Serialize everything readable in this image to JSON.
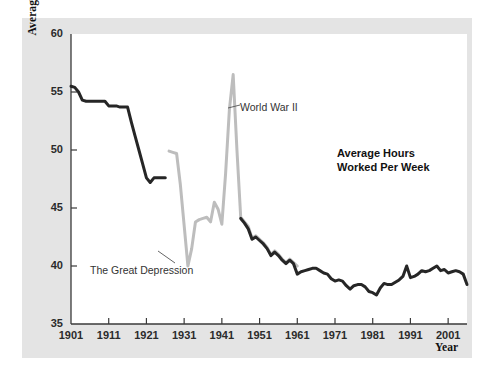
{
  "chart_data": {
    "type": "line",
    "title": "Average Hours\nWorked Per Week",
    "title_line1": "Average Hours",
    "title_line2": "Worked Per Week",
    "xlabel": "Year",
    "ylabel": "Average hours worked per week",
    "xlim": [
      1901,
      2006
    ],
    "ylim": [
      35,
      60
    ],
    "yticks": [
      35,
      40,
      45,
      50,
      55,
      60
    ],
    "xticks": [
      1901,
      1911,
      1921,
      1931,
      1941,
      1951,
      1961,
      1971,
      1981,
      1991,
      2001
    ],
    "grid": false,
    "legend": "none",
    "annotations": [
      {
        "label": "World War II",
        "x": 1944,
        "y": 56.5
      },
      {
        "label": "The Great Depression",
        "x": 1932,
        "y": 39.8
      }
    ],
    "series": [
      {
        "name": "Early period (dark)",
        "color": "#262626",
        "points": [
          [
            1901,
            55.5
          ],
          [
            1902,
            55.4
          ],
          [
            1903,
            55.0
          ],
          [
            1904,
            54.3
          ],
          [
            1905,
            54.2
          ],
          [
            1906,
            54.2
          ],
          [
            1907,
            54.2
          ],
          [
            1908,
            54.2
          ],
          [
            1909,
            54.2
          ],
          [
            1910,
            54.2
          ],
          [
            1911,
            53.8
          ],
          [
            1912,
            53.8
          ],
          [
            1913,
            53.8
          ],
          [
            1914,
            53.7
          ],
          [
            1915,
            53.7
          ],
          [
            1916,
            53.7
          ],
          [
            1917,
            52.4
          ],
          [
            1918,
            51.2
          ],
          [
            1919,
            50.0
          ],
          [
            1920,
            48.8
          ],
          [
            1921,
            47.6
          ],
          [
            1922,
            47.2
          ],
          [
            1923,
            47.6
          ],
          [
            1924,
            47.6
          ],
          [
            1925,
            47.6
          ],
          [
            1926,
            47.6
          ]
        ]
      },
      {
        "name": "Mid period (light)",
        "color": "#bdbdbd",
        "points": [
          [
            1927,
            49.9
          ],
          [
            1928,
            49.8
          ],
          [
            1929,
            49.7
          ],
          [
            1930,
            47.0
          ],
          [
            1931,
            43.5
          ],
          [
            1932,
            40.0
          ],
          [
            1933,
            41.5
          ],
          [
            1934,
            43.8
          ],
          [
            1935,
            44.0
          ],
          [
            1936,
            44.1
          ],
          [
            1937,
            44.2
          ],
          [
            1938,
            43.8
          ],
          [
            1939,
            45.5
          ],
          [
            1940,
            44.9
          ],
          [
            1941,
            43.6
          ],
          [
            1942,
            48.0
          ],
          [
            1943,
            53.5
          ],
          [
            1944,
            56.5
          ],
          [
            1945,
            50.0
          ],
          [
            1946,
            44.2
          ],
          [
            1947,
            43.8
          ],
          [
            1948,
            43.4
          ],
          [
            1949,
            42.4
          ],
          [
            1950,
            42.6
          ],
          [
            1951,
            42.3
          ],
          [
            1952,
            42.0
          ],
          [
            1953,
            41.6
          ],
          [
            1954,
            41.0
          ],
          [
            1955,
            41.3
          ],
          [
            1956,
            41.0
          ],
          [
            1957,
            40.6
          ],
          [
            1958,
            40.3
          ],
          [
            1959,
            40.6
          ],
          [
            1960,
            40.3
          ],
          [
            1961,
            40.0
          ]
        ]
      },
      {
        "name": "Modern period (dark)",
        "color": "#262626",
        "points": [
          [
            1946,
            44.1
          ],
          [
            1947,
            43.7
          ],
          [
            1948,
            43.2
          ],
          [
            1949,
            42.3
          ],
          [
            1950,
            42.5
          ],
          [
            1951,
            42.2
          ],
          [
            1952,
            41.9
          ],
          [
            1953,
            41.5
          ],
          [
            1954,
            40.9
          ],
          [
            1955,
            41.2
          ],
          [
            1956,
            40.9
          ],
          [
            1957,
            40.5
          ],
          [
            1958,
            40.2
          ],
          [
            1959,
            40.5
          ],
          [
            1960,
            40.2
          ],
          [
            1961,
            39.3
          ],
          [
            1962,
            39.5
          ],
          [
            1963,
            39.6
          ],
          [
            1964,
            39.7
          ],
          [
            1965,
            39.8
          ],
          [
            1966,
            39.8
          ],
          [
            1967,
            39.6
          ],
          [
            1968,
            39.4
          ],
          [
            1969,
            39.3
          ],
          [
            1970,
            38.9
          ],
          [
            1971,
            38.7
          ],
          [
            1972,
            38.8
          ],
          [
            1973,
            38.7
          ],
          [
            1974,
            38.3
          ],
          [
            1975,
            38.0
          ],
          [
            1976,
            38.3
          ],
          [
            1977,
            38.4
          ],
          [
            1978,
            38.4
          ],
          [
            1979,
            38.2
          ],
          [
            1980,
            37.8
          ],
          [
            1981,
            37.7
          ],
          [
            1982,
            37.5
          ],
          [
            1983,
            38.1
          ],
          [
            1984,
            38.5
          ],
          [
            1985,
            38.4
          ],
          [
            1986,
            38.4
          ],
          [
            1987,
            38.6
          ],
          [
            1988,
            38.8
          ],
          [
            1989,
            39.1
          ],
          [
            1990,
            40.0
          ],
          [
            1991,
            39.0
          ],
          [
            1992,
            39.1
          ],
          [
            1993,
            39.3
          ],
          [
            1994,
            39.6
          ],
          [
            1995,
            39.5
          ],
          [
            1996,
            39.6
          ],
          [
            1997,
            39.8
          ],
          [
            1998,
            40.0
          ],
          [
            1999,
            39.6
          ],
          [
            2000,
            39.7
          ],
          [
            2001,
            39.4
          ],
          [
            2002,
            39.5
          ],
          [
            2003,
            39.6
          ],
          [
            2004,
            39.5
          ],
          [
            2005,
            39.3
          ],
          [
            2006,
            38.4
          ]
        ]
      }
    ]
  },
  "axis": {
    "y_title": "Average hours worked per week",
    "x_title": "Year"
  }
}
